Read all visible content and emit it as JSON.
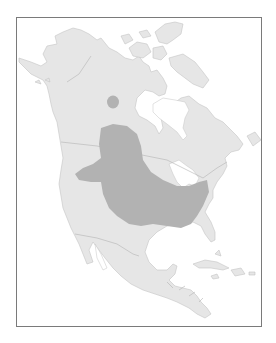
{
  "map": {
    "type": "range-map",
    "region": "North America",
    "colors": {
      "background": "#ffffff",
      "frame": "#7a7a7a",
      "land": "#e6e6e6",
      "coast": "#c4c4c4",
      "political_border": "#b4b4b4",
      "range": "#b2b2b2"
    },
    "features": [
      {
        "name": "main-range",
        "description": "Large shaded range over central Great Plains and Midwest from Alberta/Saskatchewan to the Ohio valley"
      },
      {
        "name": "disjunct-range",
        "description": "Small circular shaded area in northern Canada (Northwest Territories)"
      }
    ]
  }
}
